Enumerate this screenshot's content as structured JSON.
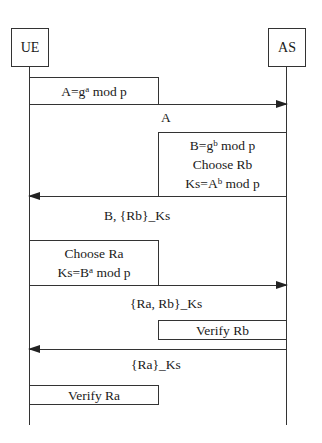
{
  "diagram": {
    "type": "sequence",
    "actors": [
      {
        "id": "ue",
        "label": "UE"
      },
      {
        "id": "as",
        "label": "AS"
      }
    ],
    "steps": [
      {
        "kind": "action",
        "actor": "UE",
        "lines": [
          {
            "pre": "A=g",
            "sup": "a",
            "post": " mod p"
          }
        ]
      },
      {
        "kind": "message",
        "from": "UE",
        "to": "AS",
        "label": "A"
      },
      {
        "kind": "action",
        "actor": "AS",
        "lines": [
          {
            "pre": "B=g",
            "sup": "b",
            "post": " mod p"
          },
          {
            "pre": "Choose Rb",
            "sup": "",
            "post": ""
          },
          {
            "pre": "Ks=A",
            "sup": "b",
            "post": " mod p"
          }
        ]
      },
      {
        "kind": "message",
        "from": "AS",
        "to": "UE",
        "label": "B, {Rb}_Ks"
      },
      {
        "kind": "action",
        "actor": "UE",
        "lines": [
          {
            "pre": "Choose Ra",
            "sup": "",
            "post": ""
          },
          {
            "pre": "Ks=B",
            "sup": "a",
            "post": " mod p"
          }
        ]
      },
      {
        "kind": "message",
        "from": "UE",
        "to": "AS",
        "label": "{Ra, Rb}_Ks"
      },
      {
        "kind": "action",
        "actor": "AS",
        "lines": [
          {
            "pre": "Verify Rb",
            "sup": "",
            "post": ""
          }
        ]
      },
      {
        "kind": "message",
        "from": "AS",
        "to": "UE",
        "label": "{Ra}_Ks"
      },
      {
        "kind": "action",
        "actor": "UE",
        "lines": [
          {
            "pre": "Verify Ra",
            "sup": "",
            "post": ""
          }
        ]
      }
    ]
  }
}
